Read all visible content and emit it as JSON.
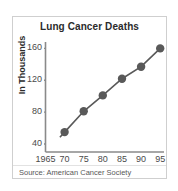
{
  "figure": {
    "title": "Lung Cancer Deaths",
    "ylabel": "In Thousands",
    "source": "Source: American Cancer Society",
    "frame_color": "#cfcfcf",
    "axis_color": "#8a8a8a",
    "series_color": "#595959",
    "text_color": "#2b2b2b"
  },
  "chart_data": {
    "type": "line",
    "title": "Lung Cancer Deaths",
    "xlabel": "",
    "ylabel": "In Thousands",
    "x": [
      1970,
      1975,
      1980,
      1985,
      1990,
      1995
    ],
    "values": [
      55,
      81,
      101,
      122,
      137,
      160
    ],
    "series": [
      {
        "name": "Lung Cancer Deaths",
        "values": [
          55,
          81,
          101,
          122,
          137,
          160
        ]
      }
    ],
    "xlim": [
      1965,
      1996
    ],
    "ylim": [
      30,
      168
    ],
    "xticks": [
      1965,
      1970,
      1975,
      1980,
      1985,
      1990,
      1995
    ],
    "xtick_labels": [
      "1965",
      "70",
      "75",
      "80",
      "85",
      "90",
      "95"
    ],
    "yticks": [
      40,
      80,
      120,
      160
    ],
    "ytick_labels": [
      "40",
      "80",
      "120",
      "160"
    ],
    "grid": false,
    "legend": false,
    "marker": "circle",
    "annotations": [
      "Source: American Cancer Society"
    ]
  }
}
